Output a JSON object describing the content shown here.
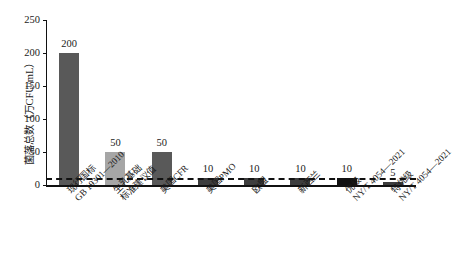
{
  "chart_data": {
    "type": "bar",
    "title": "",
    "xlabel": "",
    "ylabel": "菌落总数（万CFU/mL）",
    "ylim": [
      0,
      250
    ],
    "yticks": [
      0,
      50,
      100,
      150,
      200,
      250
    ],
    "grid": false,
    "legend": "none",
    "categories": [
      "现行国标\nGB 19301—2010",
      "生乳基础\n标准建议值",
      "美国CFR",
      "美国PMO",
      "欧盟",
      "新西兰",
      "优级\nNY/T 4054—2021",
      "特优级\nNY/T 4054—2021"
    ],
    "values": [
      200,
      50,
      50,
      10,
      10,
      10,
      10,
      5
    ],
    "bar_colors": [
      "#595959",
      "#a6a6a6",
      "#595959",
      "#3d3d3d",
      "#3d3d3d",
      "#3d3d3d",
      "#111111",
      "#3d3d3d"
    ],
    "annotations": [
      {
        "label": "建议值参考线",
        "type": "hline",
        "value": 10,
        "style": "dashed",
        "color": "#111111"
      }
    ]
  },
  "axis": {
    "y_title": "菌落总数（万CFU/mL）",
    "ticks": [
      "0",
      "50",
      "100",
      "150",
      "200",
      "250"
    ]
  },
  "bars": [
    {
      "value_label": "200",
      "cat_line1": "现行国标",
      "cat_line2": "GB 19301—2010"
    },
    {
      "value_label": "50",
      "cat_line1": "生乳基础",
      "cat_line2": "标准建议值"
    },
    {
      "value_label": "50",
      "cat_line1": "美国CFR",
      "cat_line2": ""
    },
    {
      "value_label": "10",
      "cat_line1": "美国PMO",
      "cat_line2": ""
    },
    {
      "value_label": "10",
      "cat_line1": "欧盟",
      "cat_line2": ""
    },
    {
      "value_label": "10",
      "cat_line1": "新西兰",
      "cat_line2": ""
    },
    {
      "value_label": "10",
      "cat_line1": "优级",
      "cat_line2": "NY/T 4054—2021"
    },
    {
      "value_label": "5",
      "cat_line1": "特优级",
      "cat_line2": "NY/T 4054—2021"
    }
  ]
}
